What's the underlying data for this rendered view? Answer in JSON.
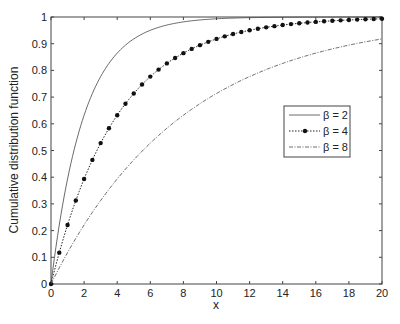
{
  "chart_data": {
    "type": "line",
    "title": "",
    "xlabel": "x",
    "ylabel": "Cumulative distribution function",
    "xlim": [
      0,
      20
    ],
    "ylim": [
      0,
      1
    ],
    "xticks": [
      "0",
      "2",
      "4",
      "6",
      "8",
      "10",
      "12",
      "14",
      "16",
      "18",
      "20"
    ],
    "yticks": [
      "0",
      "0.1",
      "0.2",
      "0.3",
      "0.4",
      "0.5",
      "0.6",
      "0.7",
      "0.8",
      "0.9",
      "1"
    ],
    "grid": false,
    "legend_position": "center-right",
    "formula": "F(x) = 1 - exp(-x/beta)",
    "series": [
      {
        "name": "β = 2",
        "beta": 2,
        "style": "solid",
        "marker": "none",
        "x": [
          0,
          1,
          2,
          3,
          4,
          5,
          6,
          8,
          10,
          12,
          14,
          16,
          18,
          20
        ],
        "values": [
          0,
          0.393,
          0.632,
          0.777,
          0.865,
          0.918,
          0.95,
          0.982,
          0.993,
          0.998,
          0.999,
          1.0,
          1.0,
          1.0
        ]
      },
      {
        "name": "β = 4",
        "beta": 4,
        "style": "dotted",
        "marker": "dot",
        "x": [
          0,
          2,
          4,
          6,
          8,
          10,
          12,
          14,
          16,
          18,
          20
        ],
        "values": [
          0,
          0.393,
          0.632,
          0.777,
          0.865,
          0.918,
          0.95,
          0.97,
          0.982,
          0.989,
          0.993
        ]
      },
      {
        "name": "β = 8",
        "beta": 8,
        "style": "dashdot",
        "marker": "none",
        "x": [
          0,
          2,
          4,
          6,
          8,
          10,
          12,
          14,
          16,
          18,
          20
        ],
        "values": [
          0,
          0.221,
          0.393,
          0.528,
          0.632,
          0.713,
          0.777,
          0.826,
          0.865,
          0.895,
          0.918
        ]
      }
    ]
  },
  "legend": {
    "items": [
      "β = 2",
      "β = 4",
      "β = 8"
    ]
  }
}
